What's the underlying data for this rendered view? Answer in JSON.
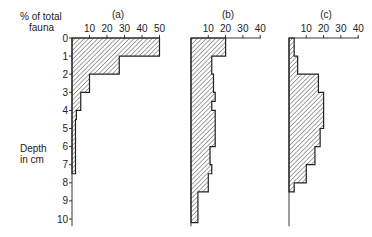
{
  "chart_data": {
    "type": "bar",
    "orientation": "horizontal-step-histogram",
    "xlabel": "% of total fauna",
    "ylabel": "Depth in cm",
    "y_ticks": [
      0,
      1,
      2,
      3,
      4,
      5,
      6,
      7,
      8,
      9,
      10
    ],
    "ylim": [
      0,
      10.3
    ],
    "panels": [
      {
        "title": "(a)",
        "x_ticks": [
          10,
          20,
          30,
          40,
          50
        ],
        "xlim": [
          0,
          50
        ],
        "bins": [
          {
            "from": 0,
            "to": 1,
            "value": 50
          },
          {
            "from": 1,
            "to": 2,
            "value": 27
          },
          {
            "from": 2,
            "to": 3,
            "value": 10
          },
          {
            "from": 3,
            "to": 4,
            "value": 5
          },
          {
            "from": 4,
            "to": 4.5,
            "value": 2.5
          },
          {
            "from": 4.5,
            "to": 7.5,
            "value": 2
          }
        ]
      },
      {
        "title": "(b)",
        "x_ticks": [
          10,
          20,
          30,
          40
        ],
        "xlim": [
          0,
          40
        ],
        "bins": [
          {
            "from": 0,
            "to": 1,
            "value": 20
          },
          {
            "from": 1,
            "to": 2,
            "value": 12
          },
          {
            "from": 2,
            "to": 3,
            "value": 13
          },
          {
            "from": 3,
            "to": 3.5,
            "value": 14
          },
          {
            "from": 3.5,
            "to": 4,
            "value": 12
          },
          {
            "from": 4,
            "to": 5,
            "value": 14
          },
          {
            "from": 5,
            "to": 6,
            "value": 14
          },
          {
            "from": 6,
            "to": 7,
            "value": 11
          },
          {
            "from": 7,
            "to": 7.5,
            "value": 12
          },
          {
            "from": 7.5,
            "to": 8.5,
            "value": 10
          },
          {
            "from": 8.5,
            "to": 10.2,
            "value": 4
          }
        ]
      },
      {
        "title": "(c)",
        "x_ticks": [
          10,
          20,
          30,
          40
        ],
        "xlim": [
          0,
          40
        ],
        "bins": [
          {
            "from": 0,
            "to": 1,
            "value": 3
          },
          {
            "from": 1,
            "to": 2,
            "value": 5
          },
          {
            "from": 2,
            "to": 3,
            "value": 17
          },
          {
            "from": 3,
            "to": 5,
            "value": 20
          },
          {
            "from": 5,
            "to": 6,
            "value": 18
          },
          {
            "from": 6,
            "to": 7,
            "value": 15
          },
          {
            "from": 7,
            "to": 8,
            "value": 10
          },
          {
            "from": 8,
            "to": 8.5,
            "value": 3
          }
        ]
      }
    ]
  },
  "labels": {
    "x_axis_line1": "% of total",
    "x_axis_line2": "fauna",
    "y_axis_line1": "Depth",
    "y_axis_line2": "in cm"
  },
  "layout": {
    "depth_y0": 38,
    "px_per_cm": 18.1,
    "panels_px": [
      {
        "x0": 72,
        "px_per_unit": 1.75,
        "axis_end": 160
      },
      {
        "x0": 191,
        "px_per_unit": 1.73,
        "axis_end": 261
      },
      {
        "x0": 289,
        "px_per_unit": 1.73,
        "axis_end": 359
      }
    ],
    "axis_bottom_cm": 10.4
  }
}
